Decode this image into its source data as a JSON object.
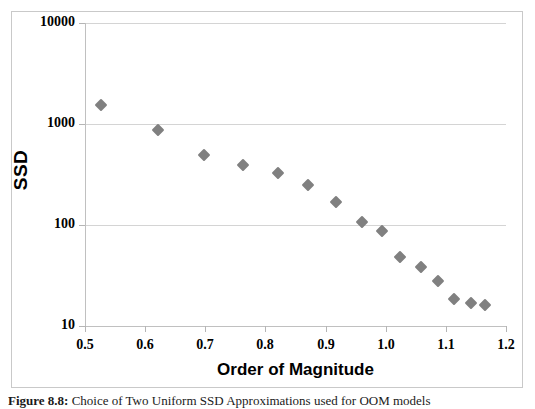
{
  "figure": {
    "caption_label": "Figure 8.8:",
    "caption_text": "Choice of Two Uniform SSD  Approximations used for OOM models"
  },
  "chart_data": {
    "type": "scatter",
    "title": "",
    "xlabel": "Order of Magnitude",
    "ylabel": "SSD",
    "yscale": "log",
    "xscale": "linear",
    "xlim": [
      0.5,
      1.2
    ],
    "ylim": [
      10,
      10000
    ],
    "grid": "horizontal",
    "legend": "none",
    "marker": "diamond",
    "marker_color": "#808080",
    "x_ticks": [
      "0.5",
      "0.6",
      "0.7",
      "0.8",
      "0.9",
      "1.0",
      "1.1",
      "1.2"
    ],
    "x_tick_values": [
      0.5,
      0.6,
      0.7,
      0.8,
      0.9,
      1.0,
      1.1,
      1.2
    ],
    "y_ticks": [
      "10000",
      "1000",
      "100",
      "10"
    ],
    "y_tick_values": [
      10000,
      1000,
      100,
      10
    ],
    "series": [
      {
        "name": "SSD",
        "points": [
          {
            "x": 0.527,
            "y": 1540
          },
          {
            "x": 0.621,
            "y": 880
          },
          {
            "x": 0.698,
            "y": 495
          },
          {
            "x": 0.762,
            "y": 390
          },
          {
            "x": 0.821,
            "y": 330
          },
          {
            "x": 0.871,
            "y": 250
          },
          {
            "x": 0.918,
            "y": 168
          },
          {
            "x": 0.961,
            "y": 108
          },
          {
            "x": 0.994,
            "y": 88
          },
          {
            "x": 1.024,
            "y": 48
          },
          {
            "x": 1.059,
            "y": 38
          },
          {
            "x": 1.087,
            "y": 28
          },
          {
            "x": 1.114,
            "y": 18.5
          },
          {
            "x": 1.141,
            "y": 16.8
          },
          {
            "x": 1.165,
            "y": 16.0
          }
        ]
      }
    ]
  },
  "colors": {
    "marker": "#808080",
    "gridline": "#d4d4d4",
    "axis_line": "#c0c0c0",
    "border": "#c9c9c9",
    "text": "#000000",
    "background": "#ffffff"
  }
}
